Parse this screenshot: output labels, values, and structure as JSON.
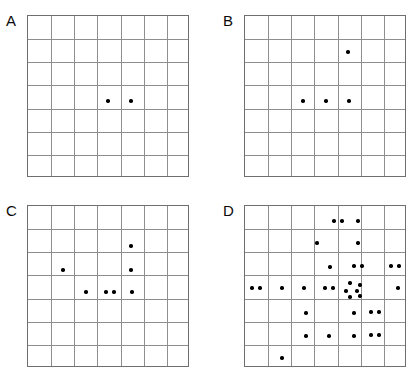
{
  "figure": {
    "panel_count": 4,
    "grid_rows": 7,
    "grid_cols": 7,
    "dot_color": "#000000",
    "grid_line_color": "#8e8e8e",
    "border_color": "#6f6f6f",
    "background_color": "#ffffff"
  },
  "panels": [
    {
      "label": "A",
      "label_x": 6,
      "label_y": 13,
      "box_x": 27,
      "box_y": 15,
      "box_w": 162,
      "box_h": 162,
      "dot_count": 2,
      "dots": [
        {
          "x": 108,
          "y": 101
        },
        {
          "x": 131,
          "y": 101
        }
      ]
    },
    {
      "label": "B",
      "label_x": 223,
      "label_y": 13,
      "box_x": 244,
      "box_y": 15,
      "box_w": 162,
      "box_h": 162,
      "dot_count": 4,
      "dots": [
        {
          "x": 348,
          "y": 52
        },
        {
          "x": 303,
          "y": 101
        },
        {
          "x": 326,
          "y": 101
        },
        {
          "x": 349,
          "y": 101
        }
      ]
    },
    {
      "label": "C",
      "label_x": 6,
      "label_y": 203,
      "box_x": 27,
      "box_y": 205,
      "box_w": 162,
      "box_h": 162,
      "dot_count": 7,
      "dots": [
        {
          "x": 131,
          "y": 246
        },
        {
          "x": 63,
          "y": 270
        },
        {
          "x": 131,
          "y": 270
        },
        {
          "x": 86,
          "y": 292
        },
        {
          "x": 106,
          "y": 292
        },
        {
          "x": 114,
          "y": 292
        },
        {
          "x": 132,
          "y": 292
        }
      ]
    },
    {
      "label": "D",
      "label_x": 223,
      "label_y": 203,
      "box_x": 244,
      "box_y": 205,
      "box_w": 162,
      "box_h": 162,
      "dot_count": 33,
      "dots": [
        {
          "x": 334,
          "y": 221
        },
        {
          "x": 342,
          "y": 221
        },
        {
          "x": 358,
          "y": 221
        },
        {
          "x": 317,
          "y": 243
        },
        {
          "x": 358,
          "y": 243
        },
        {
          "x": 330,
          "y": 267
        },
        {
          "x": 354,
          "y": 266
        },
        {
          "x": 362,
          "y": 266
        },
        {
          "x": 391,
          "y": 266
        },
        {
          "x": 399,
          "y": 266
        },
        {
          "x": 252,
          "y": 288
        },
        {
          "x": 260,
          "y": 288
        },
        {
          "x": 282,
          "y": 288
        },
        {
          "x": 304,
          "y": 288
        },
        {
          "x": 325,
          "y": 288
        },
        {
          "x": 333,
          "y": 288
        },
        {
          "x": 350,
          "y": 283
        },
        {
          "x": 360,
          "y": 285
        },
        {
          "x": 346,
          "y": 291
        },
        {
          "x": 357,
          "y": 291
        },
        {
          "x": 350,
          "y": 297
        },
        {
          "x": 360,
          "y": 296
        },
        {
          "x": 398,
          "y": 288
        },
        {
          "x": 306,
          "y": 313
        },
        {
          "x": 354,
          "y": 313
        },
        {
          "x": 371,
          "y": 312
        },
        {
          "x": 379,
          "y": 312
        },
        {
          "x": 306,
          "y": 336
        },
        {
          "x": 329,
          "y": 336
        },
        {
          "x": 354,
          "y": 336
        },
        {
          "x": 371,
          "y": 335
        },
        {
          "x": 379,
          "y": 335
        },
        {
          "x": 282,
          "y": 358
        }
      ]
    }
  ]
}
